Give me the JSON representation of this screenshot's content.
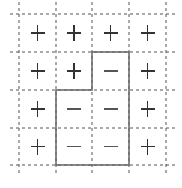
{
  "grid": {
    "rows": 4,
    "cols": 4,
    "x_lines": [
      19,
      56,
      92,
      129,
      166
    ],
    "y_lines": [
      14,
      52,
      90,
      128,
      165
    ],
    "dashed_color": "#555555",
    "solid_color": "#666666"
  },
  "cells": [
    [
      "+",
      "+",
      "+",
      "+"
    ],
    [
      "+",
      "+",
      "-",
      "+"
    ],
    [
      "+",
      "-",
      "-",
      "+"
    ],
    [
      "+",
      "-",
      "-",
      "+"
    ]
  ],
  "region_outline": {
    "description": "Solid boundary enclosing the minus cells",
    "points": [
      [
        92,
        52
      ],
      [
        129,
        52
      ],
      [
        129,
        165
      ],
      [
        56,
        165
      ],
      [
        56,
        90
      ],
      [
        92,
        90
      ]
    ]
  }
}
